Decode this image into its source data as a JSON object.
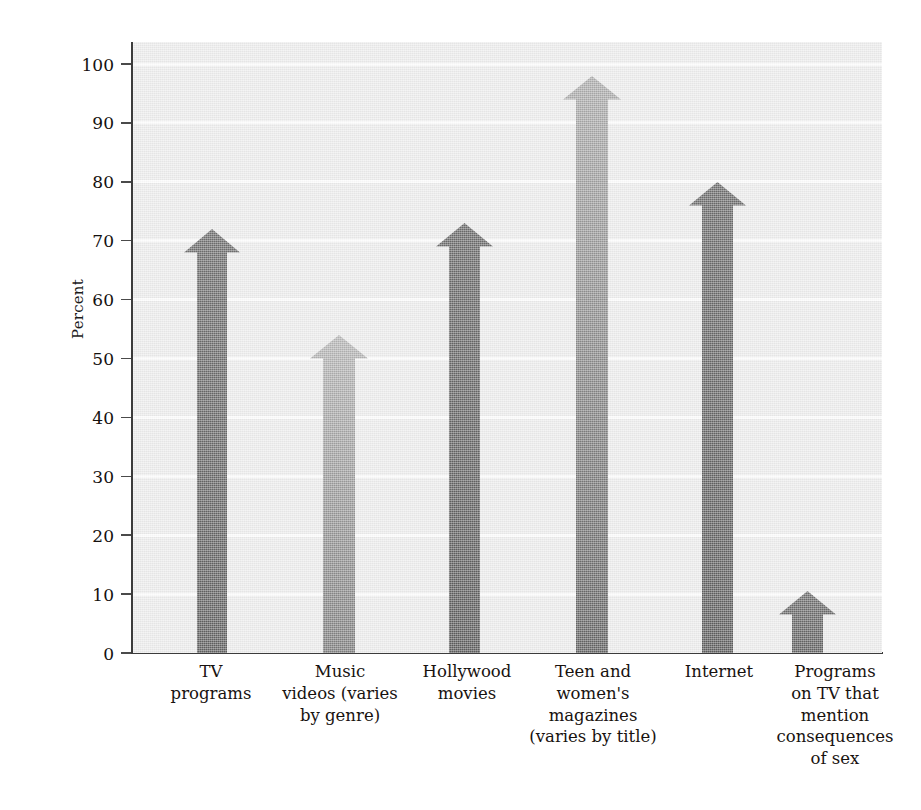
{
  "chart_data": {
    "type": "bar",
    "title": "",
    "xlabel": "",
    "ylabel": "Percent",
    "ylim": [
      0,
      100
    ],
    "grid": true,
    "legend": "none",
    "note": "Arrow-shaped bars; value is read at the arrow tip. Shaft top is where the arrowhead begins.",
    "yticks": [
      {
        "value": 100,
        "label": "100"
      },
      {
        "value": 90,
        "label": "90"
      },
      {
        "value": 80,
        "label": "80"
      },
      {
        "value": 70,
        "label": "70"
      },
      {
        "value": 60,
        "label": "60"
      },
      {
        "value": 50,
        "label": "50"
      },
      {
        "value": 40,
        "label": "40"
      },
      {
        "value": 30,
        "label": "30"
      },
      {
        "value": 20,
        "label": "20"
      },
      {
        "value": 10,
        "label": "10"
      },
      {
        "value": 0,
        "label": "0"
      }
    ],
    "categories": [
      "TV programs",
      "Music videos (varies by genre)",
      "Hollywood movies",
      "Teen and women's magazines (varies by title)",
      "Internet",
      "Programs on TV that mention consequences of sex"
    ],
    "values": [
      72,
      54,
      73,
      98,
      80,
      10
    ],
    "bars": [
      {
        "category": "TV programs",
        "label_lines": [
          "TV",
          "programs"
        ],
        "value": 72,
        "shaft_top": 68,
        "center_pct": 10.6,
        "shaft_width_px": 30,
        "head_width_px": 56,
        "color_top": "#6e6e6e",
        "color_bottom": "#5f5f5f"
      },
      {
        "category": "Music videos (varies by genre)",
        "label_lines": [
          "Music",
          "videos (varies",
          "by genre)"
        ],
        "value": 54,
        "shaft_top": 50,
        "center_pct": 27.5,
        "shaft_width_px": 32,
        "head_width_px": 58,
        "color_top": "#b4b4b4",
        "color_bottom": "#7d7d7d"
      },
      {
        "category": "Hollywood movies",
        "label_lines": [
          "Hollywood",
          "movies"
        ],
        "value": 73,
        "shaft_top": 69,
        "center_pct": 44.3,
        "shaft_width_px": 31,
        "head_width_px": 57,
        "color_top": "#6a6a6a",
        "color_bottom": "#5c5c5c"
      },
      {
        "category": "Teen and women's magazines (varies by title)",
        "label_lines": [
          "Teen and",
          "women's",
          "magazines",
          "(varies by title)"
        ],
        "value": 98,
        "shaft_top": 94,
        "center_pct": 61.3,
        "shaft_width_px": 32,
        "head_width_px": 58,
        "color_top": "#ababab",
        "color_bottom": "#616161"
      },
      {
        "category": "Internet",
        "label_lines": [
          "Internet"
        ],
        "value": 80,
        "shaft_top": 76,
        "center_pct": 78.1,
        "shaft_width_px": 31,
        "head_width_px": 57,
        "color_top": "#6b6b6b",
        "color_bottom": "#5d5d5d"
      },
      {
        "category": "Programs on TV that mention consequences of sex",
        "label_lines": [
          "Programs",
          "on TV that",
          "mention",
          "consequences",
          "of sex"
        ],
        "value": 10.5,
        "shaft_top": 6.5,
        "center_pct": 90.0,
        "shaft_width_px": 31,
        "head_width_px": 57,
        "color_top": "#6d6d6d",
        "color_bottom": "#606060"
      }
    ],
    "colors": {
      "plot_background": "#ebebeb",
      "gridline": "#fbfbfb",
      "axis": "#3c3c3c",
      "text": "#18120f",
      "bar_dark": "#666666",
      "bar_light": "#b0b0b0"
    }
  },
  "x_label_boxes": [
    {
      "left": 136,
      "width": 150,
      "lines": [
        "TV",
        "programs"
      ]
    },
    {
      "left": 257,
      "width": 166,
      "lines": [
        "Music",
        "videos (varies",
        "by genre)"
      ]
    },
    {
      "left": 389,
      "width": 156,
      "lines": [
        "Hollywood",
        "movies"
      ]
    },
    {
      "left": 508,
      "width": 170,
      "lines": [
        "Teen and",
        "women's",
        "magazines",
        "(varies by title)"
      ]
    },
    {
      "left": 644,
      "width": 150,
      "lines": [
        "Internet"
      ]
    },
    {
      "left": 752,
      "width": 166,
      "lines": [
        "Programs",
        "on TV that",
        "mention",
        "consequences",
        "of sex"
      ]
    }
  ]
}
